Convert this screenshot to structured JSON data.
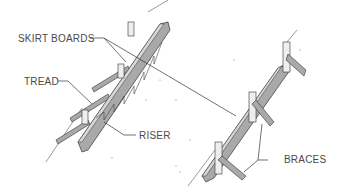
{
  "diagram": {
    "type": "isometric technical illustration",
    "labels": {
      "skirt_boards": "SKIRT BOARDS",
      "tread": "TREAD",
      "riser": "RISER",
      "braces": "BRACES"
    },
    "colors": {
      "board_face": "#a9a9a9",
      "board_edge": "#d8d8d8",
      "stake": "#eeeeee",
      "line": "#333333",
      "label_text": "#4a4a4a",
      "background": "#ffffff"
    }
  }
}
